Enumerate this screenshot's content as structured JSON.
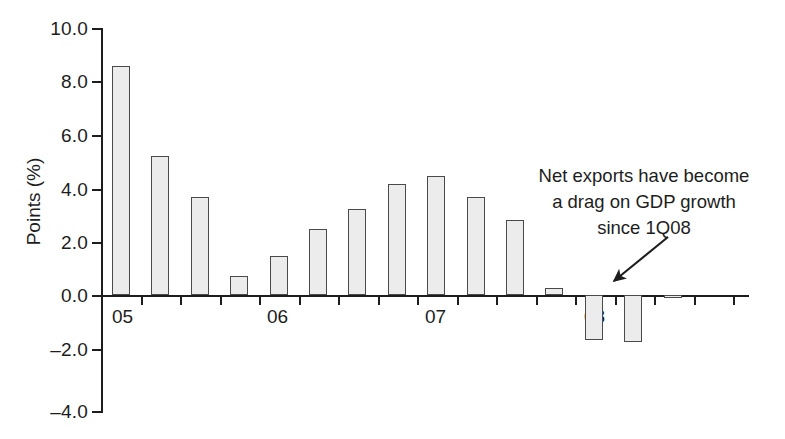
{
  "chart_data": {
    "type": "bar",
    "title": "",
    "xlabel": "",
    "ylabel": "Points (%)",
    "ylim": [
      -4.0,
      10.0
    ],
    "yticks": [
      10.0,
      8.0,
      6.0,
      4.0,
      2.0,
      0.0,
      -2.0,
      -4.0
    ],
    "ytick_labels": [
      "10.0",
      "8.0",
      "6.0",
      "4.0",
      "2.0",
      "0.0",
      "–2.0",
      "–4.0"
    ],
    "grid": false,
    "legend": null,
    "xtick_labels": [
      "05",
      "06",
      "07",
      "08"
    ],
    "categories": [
      "1Q05",
      "2Q05",
      "3Q05",
      "4Q05",
      "1Q06",
      "2Q06",
      "3Q06",
      "4Q06",
      "1Q07",
      "2Q07",
      "3Q07",
      "4Q07",
      "1Q08",
      "2Q08",
      "3Q08"
    ],
    "values": [
      8.55,
      5.2,
      3.65,
      0.7,
      1.45,
      2.45,
      3.2,
      4.15,
      4.45,
      3.65,
      2.8,
      0.25,
      -1.7,
      -1.75,
      -0.1
    ],
    "bar_color": "#ececec",
    "bar_edge_color": "#4a4a4a",
    "annotations": [
      {
        "lines": [
          "Net exports have become",
          "a drag on GDP growth",
          "since 1Q08"
        ],
        "arrow": true
      }
    ]
  },
  "axis": {
    "y_title": "Points (%)",
    "y_ticks": [
      {
        "label": "10.0",
        "value": 10.0
      },
      {
        "label": "8.0",
        "value": 8.0
      },
      {
        "label": "6.0",
        "value": 6.0
      },
      {
        "label": "4.0",
        "value": 4.0
      },
      {
        "label": "2.0",
        "value": 2.0
      },
      {
        "label": "0.0",
        "value": 0.0
      },
      {
        "label": "–2.0",
        "value": -2.0
      },
      {
        "label": "–4.0",
        "value": -4.0
      }
    ],
    "x_labels": [
      {
        "label": "05"
      },
      {
        "label": "06"
      },
      {
        "label": "07"
      },
      {
        "label": "08"
      }
    ]
  },
  "annotation": {
    "line1": "Net exports have become",
    "line2": "a drag on GDP growth",
    "line3": "since 1Q08"
  }
}
